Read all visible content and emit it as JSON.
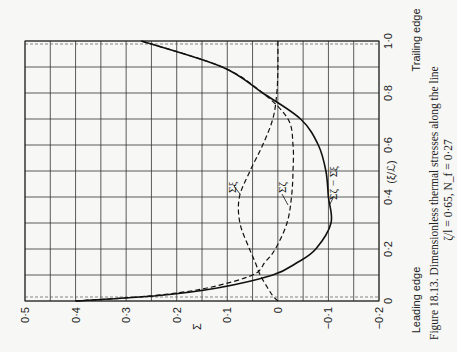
{
  "figure": {
    "caption_line1": "Figure 18.13.  Dimensionless thermal stresses along the line",
    "caption_line2": "ζ/l = 0·65, N_f = 0·27",
    "x_axis_label": "(ξ/ℒ)",
    "y_axis_label": "Σ",
    "leading_edge_label": "Leading edge",
    "trailing_edge_label": "Trailing edge",
    "x_ticks": [
      "0",
      "0·2",
      "0·4",
      "0·6",
      "0·8",
      "1·0"
    ],
    "y_ticks": [
      "0·5",
      "0·4",
      "0·3",
      "0·2",
      "0·1",
      "0",
      "−0·1",
      "−0·2"
    ],
    "series_labels": {
      "sigma_xi": "Σξ",
      "sigma_zeta": "Σζ",
      "difference": "Σζ − Σξ"
    },
    "orientation": "rotated 90° counter-clockwise on page"
  },
  "chart_data": {
    "type": "line",
    "xlabel": "(ξ/ℒ)",
    "ylabel": "Σ",
    "xlim": [
      0,
      1.0
    ],
    "ylim": [
      -0.2,
      0.5
    ],
    "grid": true,
    "x_annotations": {
      "0": "Leading edge",
      "1.0": "Trailing edge"
    },
    "x": [
      0,
      0.02,
      0.05,
      0.1,
      0.15,
      0.2,
      0.3,
      0.4,
      0.5,
      0.6,
      0.7,
      0.8,
      0.9,
      1.0
    ],
    "series": [
      {
        "name": "Σζ − Σξ",
        "style": "solid",
        "values": [
          0.4,
          0.24,
          0.12,
          0.01,
          -0.04,
          -0.075,
          -0.105,
          -0.1,
          -0.095,
          -0.08,
          -0.045,
          0.03,
          0.11,
          0.27
        ]
      },
      {
        "name": "Σζ",
        "style": "dashed",
        "values": [
          0.4,
          0.25,
          0.14,
          0.05,
          0.025,
          0.005,
          -0.018,
          -0.027,
          -0.03,
          -0.03,
          -0.02,
          0.03,
          0.11,
          0.27
        ]
      },
      {
        "name": "Σξ",
        "style": "dashed",
        "values": [
          0.0,
          0.01,
          0.02,
          0.035,
          0.045,
          0.056,
          0.075,
          0.076,
          0.055,
          0.03,
          0.01,
          0.002,
          0.0,
          0.0
        ]
      }
    ]
  }
}
